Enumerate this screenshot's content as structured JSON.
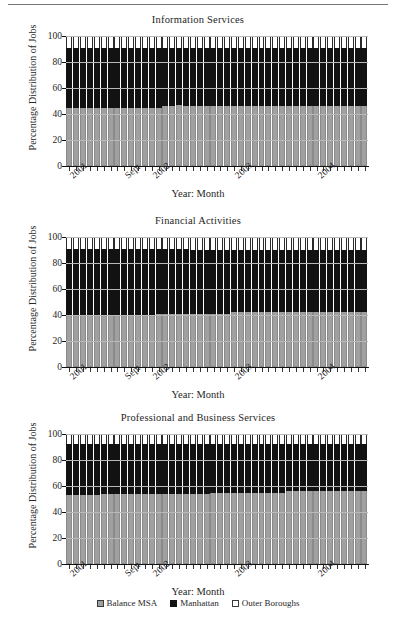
{
  "page": {
    "background": "#ffffff",
    "gray_color": "#a0a0a0",
    "black_color": "#121212",
    "white_color": "#ffffff"
  },
  "legend": {
    "position": "bottom-center",
    "items": [
      {
        "label": "Balance MSA",
        "swatch": "gray-swatch-icon",
        "color": "#a0a0a0"
      },
      {
        "label": "Manhattan",
        "swatch": "black-swatch-icon",
        "color": "#121212"
      },
      {
        "label": "Outer Boroughs",
        "swatch": "white-swatch-icon",
        "color": "#ffffff"
      }
    ]
  },
  "common": {
    "ylabel": "Percentage Distribution of Jobs",
    "xlabel": "Year: Month",
    "yticks": [
      0,
      20,
      40,
      60,
      80,
      100
    ],
    "ylim": [
      0,
      100
    ],
    "xtick_labels": [
      "2001",
      "Sept",
      "2002",
      "2003",
      "2004"
    ],
    "xtick_positions": [
      0,
      8,
      12,
      24,
      36
    ]
  },
  "chart_data": [
    {
      "type": "bar",
      "stacked": true,
      "title": "Information Services",
      "xlabel": "Year: Month",
      "ylabel": "Percentage Distribution of Jobs",
      "ylim": [
        0,
        100
      ],
      "yticks": [
        0,
        20,
        40,
        60,
        80,
        100
      ],
      "grid": true,
      "legend_position": "bottom",
      "categories": [
        "2001:Jan",
        "2001:Feb",
        "2001:Mar",
        "2001:Apr",
        "2001:May",
        "2001:Jun",
        "2001:Jul",
        "2001:Aug",
        "2001:Sept",
        "2001:Oct",
        "2001:Nov",
        "2001:Dec",
        "2002:Jan",
        "2002:Feb",
        "2002:Mar",
        "2002:Apr",
        "2002:May",
        "2002:Jun",
        "2002:Jul",
        "2002:Aug",
        "2002:Sept",
        "2002:Oct",
        "2002:Nov",
        "2002:Dec",
        "2003:Jan",
        "2003:Feb",
        "2003:Mar",
        "2003:Apr",
        "2003:May",
        "2003:Jun",
        "2003:Jul",
        "2003:Aug",
        "2003:Sept",
        "2003:Oct",
        "2003:Nov",
        "2003:Dec",
        "2004:Jan",
        "2004:Feb",
        "2004:Mar",
        "2004:Apr",
        "2004:May",
        "2004:Jun",
        "2004:Jul",
        "2004:Aug"
      ],
      "series": [
        {
          "name": "Balance MSA",
          "color": "#a0a0a0",
          "values": [
            45,
            45,
            45,
            45,
            45,
            45,
            45,
            45,
            45,
            45,
            45,
            45,
            45,
            45,
            46,
            46,
            47,
            46,
            46,
            46,
            46,
            46,
            46,
            46,
            46,
            46,
            46,
            46,
            46,
            46,
            46,
            46,
            46,
            46,
            46,
            46,
            46,
            46,
            46,
            46,
            46,
            46,
            46,
            46
          ]
        },
        {
          "name": "Manhattan",
          "color": "#121212",
          "values": [
            46,
            46,
            46,
            46,
            46,
            46,
            46,
            46,
            46,
            46,
            46,
            46,
            46,
            46,
            45,
            45,
            44,
            45,
            45,
            45,
            45,
            45,
            45,
            45,
            45,
            45,
            45,
            45,
            45,
            45,
            45,
            45,
            45,
            45,
            45,
            45,
            45,
            45,
            45,
            45,
            45,
            45,
            45,
            45
          ]
        },
        {
          "name": "Outer Boroughs",
          "color": "#ffffff",
          "values": [
            9,
            9,
            9,
            9,
            9,
            9,
            9,
            9,
            9,
            9,
            9,
            9,
            9,
            9,
            9,
            9,
            9,
            9,
            9,
            9,
            9,
            9,
            9,
            9,
            9,
            9,
            9,
            9,
            9,
            9,
            9,
            9,
            9,
            9,
            9,
            9,
            9,
            9,
            9,
            9,
            9,
            9,
            9,
            9
          ]
        }
      ]
    },
    {
      "type": "bar",
      "stacked": true,
      "title": "Financial Activities",
      "xlabel": "Year: Month",
      "ylabel": "Percentage Distribution of Jobs",
      "ylim": [
        0,
        100
      ],
      "yticks": [
        0,
        20,
        40,
        60,
        80,
        100
      ],
      "grid": true,
      "legend_position": "bottom",
      "categories": [
        "2001:Jan",
        "2001:Feb",
        "2001:Mar",
        "2001:Apr",
        "2001:May",
        "2001:Jun",
        "2001:Jul",
        "2001:Aug",
        "2001:Sept",
        "2001:Oct",
        "2001:Nov",
        "2001:Dec",
        "2002:Jan",
        "2002:Feb",
        "2002:Mar",
        "2002:Apr",
        "2002:May",
        "2002:Jun",
        "2002:Jul",
        "2002:Aug",
        "2002:Sept",
        "2002:Oct",
        "2002:Nov",
        "2002:Dec",
        "2003:Jan",
        "2003:Feb",
        "2003:Mar",
        "2003:Apr",
        "2003:May",
        "2003:Jun",
        "2003:Jul",
        "2003:Aug",
        "2003:Sept",
        "2003:Oct",
        "2003:Nov",
        "2003:Dec",
        "2004:Jan",
        "2004:Feb",
        "2004:Mar",
        "2004:Apr",
        "2004:May",
        "2004:Jun",
        "2004:Jul",
        "2004:Aug"
      ],
      "series": [
        {
          "name": "Balance MSA",
          "color": "#a0a0a0",
          "values": [
            39,
            39,
            39,
            39,
            39,
            39,
            39,
            39,
            39,
            39,
            39,
            40,
            40,
            41,
            41,
            41,
            41,
            41,
            41,
            41,
            41,
            41,
            41,
            41,
            42,
            42,
            42,
            42,
            42,
            42,
            42,
            42,
            42,
            42,
            42,
            42,
            42,
            42,
            42,
            42,
            42,
            42,
            42,
            42
          ]
        },
        {
          "name": "Manhattan",
          "color": "#121212",
          "values": [
            52,
            52,
            52,
            52,
            52,
            52,
            52,
            52,
            52,
            52,
            52,
            51,
            51,
            50,
            50,
            50,
            50,
            50,
            49,
            49,
            49,
            49,
            49,
            49,
            48,
            48,
            48,
            48,
            48,
            48,
            48,
            48,
            48,
            48,
            48,
            48,
            48,
            48,
            48,
            48,
            48,
            48,
            48,
            48
          ]
        },
        {
          "name": "Outer Boroughs",
          "color": "#ffffff",
          "values": [
            9,
            9,
            9,
            9,
            9,
            9,
            9,
            9,
            9,
            9,
            9,
            9,
            9,
            9,
            9,
            9,
            9,
            9,
            10,
            10,
            10,
            10,
            10,
            10,
            10,
            10,
            10,
            10,
            10,
            10,
            10,
            10,
            10,
            10,
            10,
            10,
            10,
            10,
            10,
            10,
            10,
            10,
            10,
            10
          ]
        }
      ]
    },
    {
      "type": "bar",
      "stacked": true,
      "title": "Professional and Business Services",
      "xlabel": "Year: Month",
      "ylabel": "Percentage Distribution of Jobs",
      "ylim": [
        0,
        100
      ],
      "yticks": [
        0,
        20,
        40,
        60,
        80,
        100
      ],
      "grid": true,
      "legend_position": "bottom",
      "categories": [
        "2001:Jan",
        "2001:Feb",
        "2001:Mar",
        "2001:Apr",
        "2001:May",
        "2001:Jun",
        "2001:Jul",
        "2001:Aug",
        "2001:Sept",
        "2001:Oct",
        "2001:Nov",
        "2001:Dec",
        "2002:Jan",
        "2002:Feb",
        "2002:Mar",
        "2002:Apr",
        "2002:May",
        "2002:Jun",
        "2002:Jul",
        "2002:Aug",
        "2002:Sept",
        "2002:Oct",
        "2002:Nov",
        "2002:Dec",
        "2003:Jan",
        "2003:Feb",
        "2003:Mar",
        "2003:Apr",
        "2003:May",
        "2003:Jun",
        "2003:Jul",
        "2003:Aug",
        "2003:Sept",
        "2003:Oct",
        "2003:Nov",
        "2003:Dec",
        "2004:Jan",
        "2004:Feb",
        "2004:Mar",
        "2004:Apr",
        "2004:May",
        "2004:Jun",
        "2004:Jul",
        "2004:Aug"
      ],
      "series": [
        {
          "name": "Balance MSA",
          "color": "#a0a0a0",
          "values": [
            53,
            53,
            53,
            53,
            53,
            54,
            54,
            54,
            54,
            54,
            54,
            54,
            54,
            54,
            54,
            54,
            54,
            54,
            54,
            54,
            54,
            55,
            55,
            55,
            55,
            55,
            55,
            55,
            55,
            55,
            55,
            55,
            56,
            56,
            56,
            56,
            56,
            56,
            56,
            56,
            56,
            56,
            56,
            56
          ]
        },
        {
          "name": "Manhattan",
          "color": "#121212",
          "values": [
            39,
            39,
            39,
            39,
            39,
            38,
            38,
            38,
            38,
            38,
            38,
            38,
            38,
            38,
            38,
            38,
            38,
            38,
            38,
            38,
            38,
            37,
            37,
            37,
            37,
            37,
            37,
            37,
            37,
            37,
            37,
            37,
            36,
            36,
            36,
            36,
            36,
            36,
            36,
            36,
            36,
            36,
            36,
            36
          ]
        },
        {
          "name": "Outer Boroughs",
          "color": "#ffffff",
          "values": [
            8,
            8,
            8,
            8,
            8,
            8,
            8,
            8,
            8,
            8,
            8,
            8,
            8,
            8,
            8,
            8,
            8,
            8,
            8,
            8,
            8,
            8,
            8,
            8,
            8,
            8,
            8,
            8,
            8,
            8,
            8,
            8,
            8,
            8,
            8,
            8,
            8,
            8,
            8,
            8,
            8,
            8,
            8,
            8
          ]
        }
      ]
    }
  ]
}
